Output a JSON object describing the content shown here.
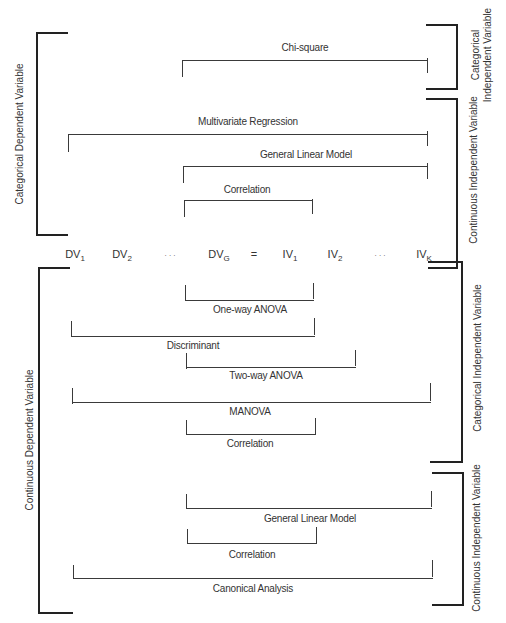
{
  "diagram": {
    "variables_row": {
      "dependent": [
        {
          "name": "DV",
          "sub": "1"
        },
        {
          "name": "DV",
          "sub": "2"
        },
        {
          "name": ". . .",
          "sub": ""
        },
        {
          "name": "DV",
          "sub": "G"
        }
      ],
      "equals": "=",
      "independent": [
        {
          "name": "IV",
          "sub": "1"
        },
        {
          "name": "IV",
          "sub": "2"
        },
        {
          "name": ". . .",
          "sub": ""
        },
        {
          "name": "IV",
          "sub": "K"
        }
      ]
    },
    "left_groups": [
      {
        "label": "Categorical Dependent Variable"
      },
      {
        "label": "Continuous Dependent Variable"
      }
    ],
    "right_groups": [
      {
        "label_line1": "Categorical",
        "label_line2": "Independent Variable"
      },
      {
        "label": "Continuous Independent Variable"
      },
      {
        "label": "Categorical Independent Variable"
      },
      {
        "label": "Continuous Independent Variable"
      }
    ],
    "top_methods": [
      {
        "label": "Chi-square"
      },
      {
        "label": "Multivariate Regression"
      },
      {
        "label": "General Linear Model"
      },
      {
        "label": "Correlation"
      }
    ],
    "bottom_methods": [
      {
        "label": "One-way ANOVA"
      },
      {
        "label": "Discriminant"
      },
      {
        "label": "Two-way ANOVA"
      },
      {
        "label": "MANOVA"
      },
      {
        "label": "Correlation"
      },
      {
        "label": "General Linear Model"
      },
      {
        "label": "Correlation"
      },
      {
        "label": "Canonical Analysis"
      }
    ]
  }
}
